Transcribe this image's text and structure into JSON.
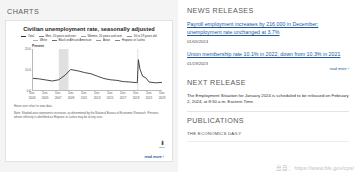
{
  "left": {
    "section_title": "CHARTS",
    "chart_title": "Civilian unemployment rate, seasonally adjusted",
    "y_unit_label": "Percent",
    "source_note": "Hover over chart to view data.",
    "footnote": "Note: Shaded area represents recession, as determined by the National Bureau of Economic Research. Persons whose ethnicity is identified as Hispanic or Latino may be of any race.",
    "download_label": "Excel",
    "read_more": "read more ›"
  },
  "chart_data": {
    "type": "line",
    "title": "Civilian unemployment rate, seasonally adjusted",
    "xlabel": "",
    "ylabel": "Percent",
    "ylim": [
      0,
      20
    ],
    "yticks": [
      "0.0",
      "10.0",
      "20.0"
    ],
    "grid": false,
    "legend_position": "top",
    "x_tick_labels": [
      [
        "Dec",
        "2003"
      ],
      [
        "Dec",
        "2005"
      ],
      [
        "Dec",
        "2007"
      ],
      [
        "Dec",
        "2009"
      ],
      [
        "Dec",
        "2011"
      ],
      [
        "Dec",
        "2013"
      ],
      [
        "Dec",
        "2015"
      ],
      [
        "Dec",
        "2017"
      ],
      [
        "Dec",
        "2019"
      ],
      [
        "Dec",
        "2021"
      ],
      [
        "Dec",
        "2023"
      ]
    ],
    "legend": [
      {
        "label": "Total",
        "color": "#333333"
      },
      {
        "label": "Men, 20 years and over",
        "color": "#7a7a7a"
      },
      {
        "label": "Women, 20 years and over",
        "color": "#a0a0a0"
      },
      {
        "label": "16 to 19 years old",
        "color": "#8d8d8d"
      },
      {
        "label": "White",
        "color": "#b0b0b0"
      },
      {
        "label": "Black or African American",
        "color": "#6e6e6e"
      },
      {
        "label": "Asian",
        "color": "#9a9a9a"
      },
      {
        "label": "Hispanic or Latino",
        "color": "#888888"
      }
    ],
    "recession_bands": [
      {
        "start": "2007-12",
        "end": "2009-06"
      },
      {
        "start": "2020-02",
        "end": "2020-04"
      }
    ],
    "series": [
      {
        "name": "Total",
        "color": "#333333",
        "x": [
          "2003-12",
          "2004-12",
          "2005-12",
          "2006-12",
          "2007-12",
          "2008-12",
          "2009-10",
          "2010-12",
          "2011-12",
          "2012-12",
          "2013-12",
          "2014-12",
          "2015-12",
          "2016-12",
          "2017-12",
          "2018-12",
          "2019-12",
          "2020-02",
          "2020-04",
          "2020-07",
          "2020-12",
          "2021-06",
          "2021-12",
          "2022-12",
          "2023-12"
        ],
        "values": [
          5.7,
          5.4,
          4.9,
          4.4,
          5.0,
          7.3,
          10.0,
          9.3,
          8.5,
          7.9,
          6.7,
          5.6,
          5.0,
          4.7,
          4.1,
          3.9,
          3.6,
          3.5,
          14.8,
          10.2,
          6.7,
          5.9,
          3.9,
          3.5,
          3.7
        ]
      }
    ]
  },
  "right": {
    "news_title": "NEWS RELEASES",
    "releases": [
      {
        "headline": "Payroll employment increases by 216,000 in December; unemployment rate unchanged at 3.7%",
        "date": "01/05/2024"
      },
      {
        "headline": "Union membership rate 10.1% in 2022, down from 10.3% in 2021",
        "date": "01/19/2023"
      }
    ],
    "read_more": "read more ›",
    "next_release_title": "NEXT RELEASE",
    "next_release_text": "The Employment Situation for January 2024 is scheduled to be released on February 2, 2024, at 8:30 a.m. Eastern Time.",
    "publications_title": "PUBLICATIONS",
    "publications_sub": "THE ECONOMICS DAILY"
  },
  "watermark": "出自：https://www.bls.gov/cps/"
}
